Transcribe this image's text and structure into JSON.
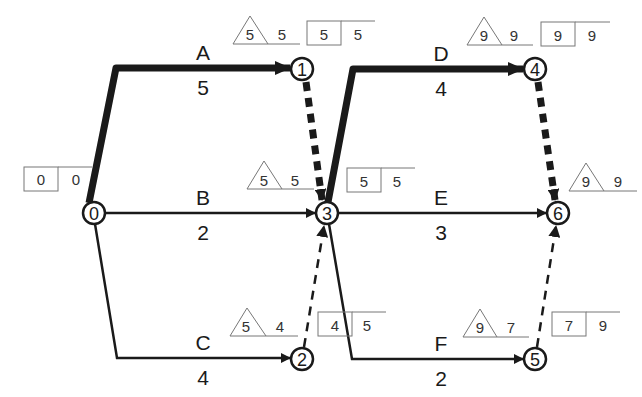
{
  "diagram": {
    "type": "activity-on-arrow network (critical path)",
    "colors": {
      "line": "#1a1a1a",
      "box": "#777777",
      "background": "#ffffff"
    },
    "nodes": [
      {
        "id": "0",
        "label": "0",
        "x": 94,
        "y": 213
      },
      {
        "id": "1",
        "label": "1",
        "x": 302,
        "y": 69
      },
      {
        "id": "2",
        "label": "2",
        "x": 302,
        "y": 359
      },
      {
        "id": "3",
        "label": "3",
        "x": 327,
        "y": 213
      },
      {
        "id": "4",
        "label": "4",
        "x": 535,
        "y": 69
      },
      {
        "id": "5",
        "label": "5",
        "x": 535,
        "y": 359
      },
      {
        "id": "6",
        "label": "6",
        "x": 558,
        "y": 213
      }
    ],
    "activities": [
      {
        "name": "A",
        "duration": "5",
        "from": "0",
        "to": "1",
        "critical": true
      },
      {
        "name": "B",
        "duration": "2",
        "from": "0",
        "to": "3",
        "critical": false
      },
      {
        "name": "C",
        "duration": "4",
        "from": "0",
        "to": "2",
        "critical": false
      },
      {
        "name": "D",
        "duration": "4",
        "from": "3",
        "to": "4",
        "critical": true
      },
      {
        "name": "E",
        "duration": "3",
        "from": "3",
        "to": "6",
        "critical": false
      },
      {
        "name": "F",
        "duration": "2",
        "from": "3",
        "to": "5",
        "critical": false
      }
    ],
    "dummies": [
      {
        "from": "1",
        "to": "3",
        "critical": true
      },
      {
        "from": "2",
        "to": "3",
        "critical": false
      },
      {
        "from": "4",
        "to": "6",
        "critical": true
      },
      {
        "from": "5",
        "to": "6",
        "critical": false
      }
    ],
    "event_times": {
      "node0": {
        "box_a": "0",
        "box_b": "0"
      },
      "node1_tri": {
        "tri": "5",
        "val": "5"
      },
      "node1_box": {
        "box_a": "5",
        "box_b": "5"
      },
      "node3_tri": {
        "tri": "5",
        "val": "5"
      },
      "node3_box": {
        "box_a": "5",
        "box_b": "5"
      },
      "node2_tri": {
        "tri": "5",
        "val": "4"
      },
      "node2_box": {
        "box_a": "4",
        "box_b": "5"
      },
      "node4_tri": {
        "tri": "9",
        "val": "9"
      },
      "node4_box": {
        "box_a": "9",
        "box_b": "9"
      },
      "node6_tri": {
        "tri": "9",
        "val": "9"
      },
      "node5_tri": {
        "tri": "9",
        "val": "7"
      },
      "node5_box": {
        "box_a": "7",
        "box_b": "9"
      }
    }
  }
}
